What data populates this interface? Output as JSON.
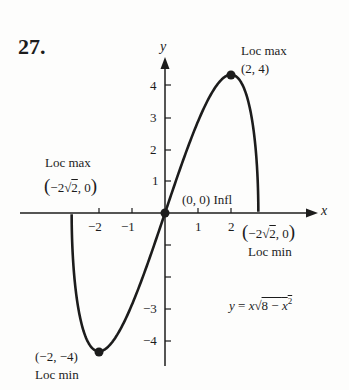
{
  "problem_number": "27.",
  "chart_data": {
    "type": "line",
    "function": "y = x*sqrt(8 - x^2)",
    "equation_label": "y = x√(8 − x²)",
    "domain": [
      -2.8284,
      2.8284
    ],
    "xlabel": "x",
    "ylabel": "y",
    "x_ticks": [
      -2,
      -1,
      1,
      2
    ],
    "y_ticks": [
      -4,
      -3,
      -2,
      -1,
      1,
      2,
      3,
      4
    ],
    "y_tick_labels_shown": [
      "4",
      "3",
      "2",
      "1",
      "−3",
      "−4"
    ],
    "x_tick_labels_shown": [
      "−2",
      "−1",
      "1",
      "2"
    ],
    "grid": false,
    "points": [
      {
        "x": -2,
        "y": -4,
        "label": "(−2, −4)",
        "note": "Loc min"
      },
      {
        "x": 0,
        "y": 0,
        "label": "(0, 0)",
        "note": "Infl"
      },
      {
        "x": 2,
        "y": 4,
        "label": "(2, 4)",
        "note": "Loc max"
      },
      {
        "x": -2.8284,
        "y": 0,
        "label": "(−2√2, 0)",
        "note": "Loc max"
      },
      {
        "x": 2.8284,
        "y": 0,
        "label": "(−2√2, 0)",
        "note": "Loc min"
      }
    ],
    "sample_values": {
      "x": [
        -2.8284,
        -2.5,
        -2,
        -1.5,
        -1,
        -0.5,
        0,
        0.5,
        1,
        1.5,
        2,
        2.5,
        2.8284
      ],
      "y": [
        0,
        -3.31,
        -4,
        -3.6,
        -2.65,
        -1.39,
        0,
        1.39,
        2.65,
        3.6,
        4,
        3.31,
        0
      ]
    }
  },
  "labels": {
    "x_axis": "x",
    "y_axis": "y",
    "loc_max_top": "Loc max",
    "loc_max_top_coord": "(2, 4)",
    "loc_max_left": "Loc max",
    "left_root_prefix": "−2",
    "left_root_radicand": "2",
    "left_root_suffix": ", 0",
    "right_root_prefix": "−2",
    "right_root_radicand": "2",
    "right_root_suffix": ", 0",
    "loc_min_right": "Loc min",
    "origin": "(0, 0) Infl",
    "loc_min_bottom_coord": "(−2, −4)",
    "loc_min_bottom": "Loc min",
    "eq_y": "y",
    "eq_eq": " = ",
    "eq_x": "x",
    "eq_radicand": "8 − ",
    "eq_x2": "x",
    "eq_exp": "2"
  },
  "ticks": {
    "x_neg2": "−2",
    "x_neg1": "−1",
    "x_1": "1",
    "x_2": "2",
    "y_4": "4",
    "y_3": "3",
    "y_2": "2",
    "y_1": "1",
    "y_neg3": "−3",
    "y_neg4": "−4"
  },
  "colors": {
    "ink": "#1c1c1c",
    "paper": "#fdfdfc"
  }
}
